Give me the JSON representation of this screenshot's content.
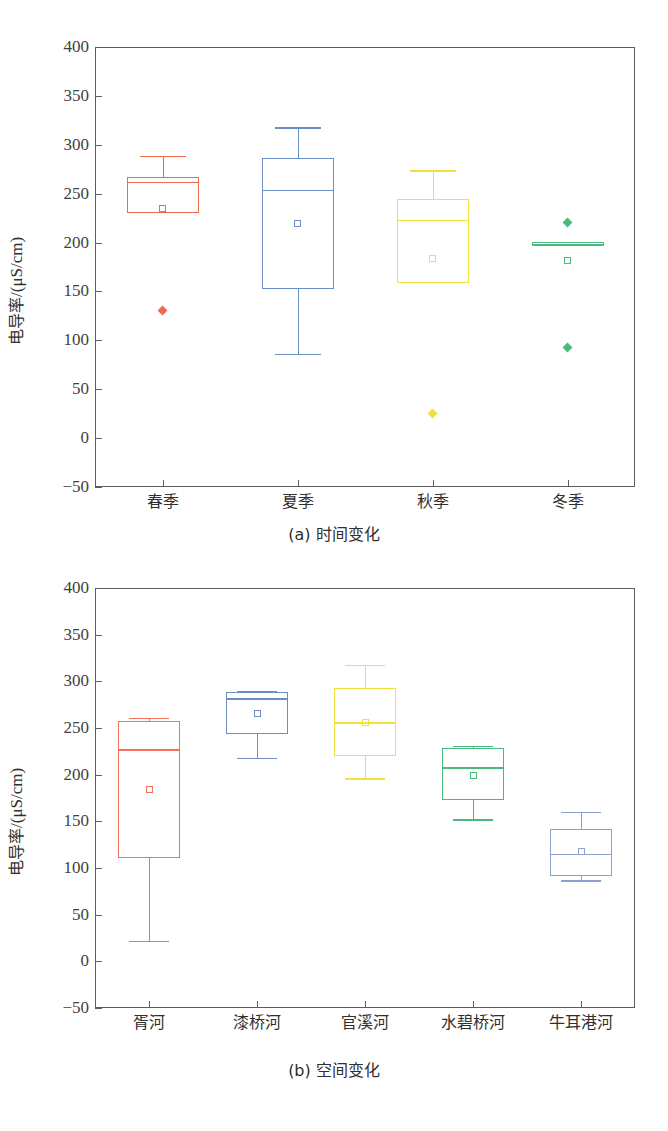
{
  "figure": {
    "ylabel_text": "电导率/(μS/cm)",
    "ylabel_prefix": "电导率",
    "ylabel_units": "/(μS/cm)",
    "bottom_note": ""
  },
  "chart_data": [
    {
      "type": "box",
      "panel": "a",
      "title": "",
      "caption": "(a) 时间变化",
      "xlabel": "",
      "ylabel": "电导率/(μS/cm)",
      "ylim": [
        -50,
        400
      ],
      "yticks": [
        400,
        350,
        300,
        250,
        200,
        150,
        100,
        50,
        0,
        -50
      ],
      "ytick_labels": [
        "400",
        "350",
        "300",
        "250",
        "200",
        "150",
        "100",
        "50",
        "0",
        "−50"
      ],
      "grid": false,
      "legend": "none",
      "categories": [
        "春季",
        "夏季",
        "秋季",
        "冬季"
      ],
      "boxes": [
        {
          "name": "春季",
          "color": "#ef6a4c",
          "whisker_low": 230,
          "q1": 230,
          "median": 262,
          "q3": 267,
          "whisker_high": 289,
          "mean": 235,
          "outliers": [
            131
          ]
        },
        {
          "name": "夏季",
          "color": "#6a8fc0",
          "whisker_low": 86,
          "q1": 152,
          "median": 254,
          "q3": 286,
          "whisker_high": 318,
          "mean": 219,
          "outliers": []
        },
        {
          "name": "秋季",
          "color": "#f3e03a",
          "whisker_low": 159,
          "q1": 159,
          "median": 223,
          "q3": 245,
          "whisker_high": 274,
          "mean": 184,
          "outliers": [
            25
          ]
        },
        {
          "name": "冬季",
          "color": "#49b97c",
          "whisker_low": 196,
          "q1": 196,
          "median": 199,
          "q3": 201,
          "whisker_high": 201,
          "mean": 182,
          "outliers": [
            221,
            93
          ]
        }
      ]
    },
    {
      "type": "box",
      "panel": "b",
      "title": "",
      "caption": "(b) 空间变化",
      "xlabel": "",
      "ylabel": "电导率/(μS/cm)",
      "ylim": [
        -50,
        400
      ],
      "yticks": [
        400,
        350,
        300,
        250,
        200,
        150,
        100,
        50,
        0,
        -50
      ],
      "ytick_labels": [
        "400",
        "350",
        "300",
        "250",
        "200",
        "150",
        "100",
        "50",
        "0",
        "−50"
      ],
      "grid": false,
      "legend": "none",
      "categories": [
        "胥河",
        "漆桥河",
        "官溪河",
        "水碧桥河",
        "牛耳港河"
      ],
      "boxes": [
        {
          "name": "胥河",
          "color": "#f4705a",
          "whisker_low": 22,
          "q1": 111,
          "median": 227,
          "q3": 257,
          "whisker_high": 261,
          "mean": 184,
          "outliers": []
        },
        {
          "name": "漆桥河",
          "color": "#6a8fc0",
          "whisker_low": 218,
          "q1": 244,
          "median": 282,
          "q3": 289,
          "whisker_high": 290,
          "mean": 266,
          "outliers": []
        },
        {
          "name": "官溪河",
          "color": "#f3e03a",
          "whisker_low": 196,
          "q1": 220,
          "median": 256,
          "q3": 293,
          "whisker_high": 318,
          "mean": 256,
          "outliers": []
        },
        {
          "name": "水碧桥河",
          "color": "#49b97c",
          "whisker_low": 152,
          "q1": 173,
          "median": 208,
          "q3": 229,
          "whisker_high": 231,
          "mean": 199,
          "outliers": []
        },
        {
          "name": "牛耳港河",
          "color": "#8e9fd0",
          "whisker_low": 87,
          "q1": 91,
          "median": 115,
          "q3": 142,
          "whisker_high": 160,
          "mean": 118,
          "outliers": []
        }
      ]
    }
  ]
}
